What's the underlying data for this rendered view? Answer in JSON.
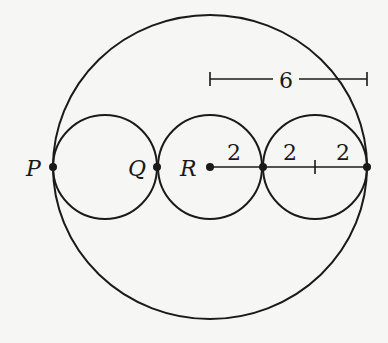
{
  "diagram": {
    "outer_circle": {
      "cx": 210,
      "cy": 167,
      "rx": 157,
      "ry": 152
    },
    "small_circles": [
      {
        "cx": 105,
        "cy": 167,
        "r": 52
      },
      {
        "cx": 210,
        "cy": 167,
        "r": 52
      },
      {
        "cx": 315,
        "cy": 167,
        "r": 52
      }
    ],
    "points": [
      {
        "name": "P",
        "label": "P",
        "x": 53,
        "y": 167,
        "lx": 26,
        "ly": 176
      },
      {
        "name": "Q",
        "label": "Q",
        "x": 157,
        "y": 167,
        "lx": 128,
        "ly": 176
      },
      {
        "name": "R",
        "label": "R",
        "x": 210,
        "y": 167,
        "lx": 180,
        "ly": 176
      },
      {
        "name": "J",
        "label": "",
        "x": 263,
        "y": 167
      },
      {
        "name": "E",
        "label": "",
        "x": 367,
        "y": 167
      }
    ],
    "segment_labels": [
      {
        "text": "2",
        "x": 227,
        "y": 160
      },
      {
        "text": "2",
        "x": 283,
        "y": 160
      },
      {
        "text": "2",
        "x": 336,
        "y": 160
      }
    ],
    "dimension": {
      "label": "6",
      "x1": 210,
      "x2": 367,
      "y": 79,
      "label_x": 286,
      "label_y": 88
    }
  }
}
